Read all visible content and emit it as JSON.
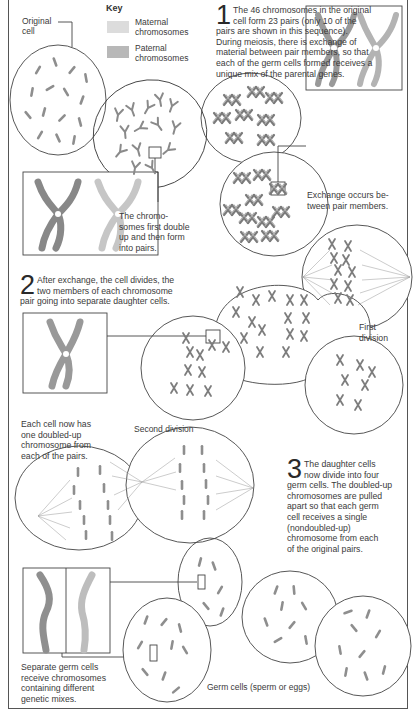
{
  "diagram": {
    "colors": {
      "maternal": "#dcdcdc",
      "paternal": "#b8b8b8",
      "line": "#444444",
      "text": "#3a3a3a",
      "chromosome_fill": "#9a9a9a"
    },
    "key": {
      "title": "Key",
      "items": [
        {
          "label_line1": "Maternal",
          "label_line2": "chromosomes",
          "color": "#dcdcdc"
        },
        {
          "label_line1": "Paternal",
          "label_line2": "chromosomes",
          "color": "#b8b8b8"
        }
      ]
    },
    "labels": {
      "original_cell_line1": "Original",
      "original_cell_line2": "cell",
      "double_up": [
        "The chromo-",
        "somes first double",
        "up and then form",
        "into pairs."
      ],
      "exchange": [
        "Exchange occurs be-",
        "tween pair members."
      ],
      "first_division": [
        "First",
        "division"
      ],
      "each_cell": [
        "Each cell now has",
        "one doubled-up",
        "chromosome from",
        "each of the pairs."
      ],
      "second_division": "Second division",
      "separate_germ": [
        "Separate germ cells",
        "receive chromosomes",
        "containing different",
        "genetic mixes."
      ],
      "germ_cells": "Germ cells (sperm or eggs)"
    },
    "steps": [
      {
        "number": "1",
        "lines": [
          "The 46 chromosomes in the original",
          "cell form 23 pairs (only 10 of the",
          "pairs are shown in this sequence).",
          "During meiosis, there is exchange of",
          "material between pair members, so that",
          "each of the germ cells formed receives a",
          "unique mix of the parental genes."
        ]
      },
      {
        "number": "2",
        "lines": [
          "After exchange, the cell divides, the",
          "two members of each chromosome",
          "pair going into separate daughter cells."
        ]
      },
      {
        "number": "3",
        "lines": [
          "The daughter cells",
          "now divide into four",
          "germ cells. The doubled-up",
          "chromosomes are pulled",
          "apart so that each germ",
          "cell receives a single",
          "(nondoubled-up)",
          "chromosome from each",
          "of the original pairs."
        ]
      }
    ]
  }
}
